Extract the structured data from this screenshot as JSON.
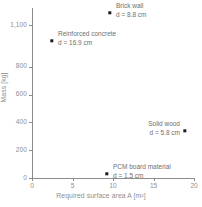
{
  "chart_data": {
    "type": "scatter",
    "title": "",
    "xlabel": "Required surface area A [m²]",
    "ylabel": "Mass [kg]",
    "xlim": [
      0,
      20
    ],
    "ylim": [
      0,
      1100
    ],
    "grid": false,
    "legend": "none",
    "xticks": [
      "0",
      "5",
      "10",
      "15",
      "20"
    ],
    "xtick_values": [
      0,
      5,
      10,
      15,
      20
    ],
    "yticks": [
      "0",
      "200",
      "400",
      "600",
      "800",
      "1,100"
    ],
    "ytick_values": [
      0,
      200,
      400,
      600,
      800,
      1100
    ],
    "marker_color": "#1b1b1b",
    "axis_color": "#8c8c8c",
    "text_color": "#8e8e8e",
    "points": [
      {
        "name": "Brick wall",
        "detail": "d = 8.8 cm",
        "x": 9.6,
        "y": 1190,
        "thickness_cm": 8.8,
        "label_anchor": "left",
        "px": 110,
        "py": 13,
        "label_px": 116,
        "label_py": 2
      },
      {
        "name": "Reinforced concrete",
        "detail": "d = 16.9 cm",
        "x": 2.5,
        "y": 990,
        "thickness_cm": 16.9,
        "label_anchor": "left",
        "px": 52,
        "py": 41,
        "label_px": 58,
        "label_py": 30
      },
      {
        "name": "Solid wood",
        "detail": "d = 5.8 cm",
        "x": 18.9,
        "y": 340,
        "thickness_cm": 5.8,
        "label_anchor": "right",
        "px": 185,
        "py": 131,
        "label_px": 180,
        "label_py": 120
      },
      {
        "name": "PCM board material",
        "detail": "d = 1.5 cm",
        "x": 9.3,
        "y": 30,
        "thickness_cm": 1.5,
        "label_anchor": "left",
        "px": 107,
        "py": 174,
        "label_px": 113,
        "label_py": 163
      }
    ]
  }
}
